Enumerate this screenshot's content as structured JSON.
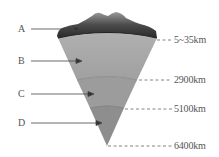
{
  "diagram": {
    "layers": [
      {
        "label": "A",
        "name": "crust"
      },
      {
        "label": "B",
        "name": "mantle"
      },
      {
        "label": "C",
        "name": "outer core"
      },
      {
        "label": "D",
        "name": "inner core"
      }
    ],
    "depths": [
      "5~35km",
      "2900km",
      "5100km",
      "6400km"
    ],
    "colors": {
      "crust": "#3a3a3a",
      "mantle": "#a8a8a8",
      "outer_core": "#9a9a9a",
      "inner_core": "#8c8c8c",
      "text": "#555555"
    }
  }
}
